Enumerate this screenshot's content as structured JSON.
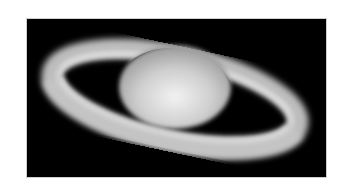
{
  "image": {
    "subject": "Saturn telescope image",
    "background_color": "#000000",
    "page_color": "#ffffff",
    "planet_color": "#d9d9d9",
    "ring_color": "#cfcfcf"
  }
}
